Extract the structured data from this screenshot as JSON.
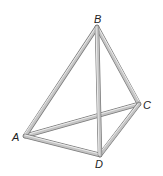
{
  "figure": {
    "type": "tetrahedron-frame",
    "vertices": [
      {
        "label": "A",
        "x": 25,
        "y": 136
      },
      {
        "label": "B",
        "x": 97,
        "y": 27
      },
      {
        "label": "C",
        "x": 139,
        "y": 104
      },
      {
        "label": "D",
        "x": 100,
        "y": 155
      }
    ],
    "edges": [
      "AB",
      "BC",
      "BD",
      "AC",
      "AD",
      "CD"
    ],
    "labels": {
      "A": "A",
      "B": "B",
      "C": "C",
      "D": "D"
    },
    "colors": {
      "rod": "#b5b5b5",
      "rod_highlight": "#e8e8e8",
      "rod_shadow": "#7a7a7a",
      "label": "#222222"
    }
  }
}
